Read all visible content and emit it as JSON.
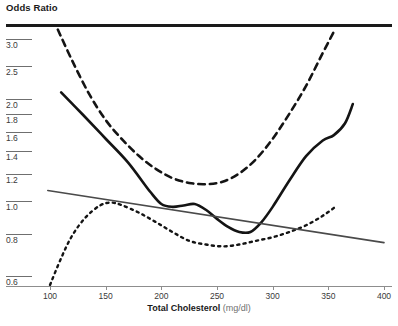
{
  "chart_data": {
    "type": "line",
    "title": "",
    "ylabel": "Odds Ratio",
    "xlabel": "Total Cholesterol",
    "xlabel_units": "(mg/dl)",
    "x_unit_note": "mg/dl",
    "scale": {
      "y": "log",
      "x": "linear"
    },
    "grid": false,
    "legend": "none",
    "xlim": [
      95,
      405
    ],
    "ylim": [
      0.6,
      3.4
    ],
    "xticks": [
      100,
      150,
      200,
      250,
      300,
      350,
      400
    ],
    "xtick_labels": [
      "100",
      "150",
      "200",
      "250",
      "300",
      "350",
      "400"
    ],
    "yticks": [
      0.6,
      0.8,
      1.0,
      1.2,
      1.4,
      1.6,
      1.8,
      2.0,
      2.5,
      3.0
    ],
    "ytick_labels": [
      "0.6",
      "0.8",
      "1.0",
      "1.2",
      "1.4",
      "1.6",
      "1.8",
      "2.0",
      "2.5",
      "3.0"
    ],
    "series": [
      {
        "name": "dashed-curve",
        "style": "dashed",
        "color": "#141414",
        "x": [
          107,
          120,
          135,
          150,
          165,
          180,
          195,
          210,
          225,
          240,
          255,
          270,
          285,
          300,
          315,
          330,
          345,
          356
        ],
        "y": [
          3.4,
          2.75,
          2.2,
          1.84,
          1.61,
          1.44,
          1.32,
          1.24,
          1.2,
          1.19,
          1.21,
          1.28,
          1.41,
          1.62,
          1.92,
          2.32,
          2.9,
          3.4
        ]
      },
      {
        "name": "solid-curve",
        "style": "solid",
        "color": "#141414",
        "x": [
          110,
          130,
          150,
          170,
          190,
          200,
          210,
          220,
          230,
          240,
          250,
          260,
          270,
          280,
          290,
          300,
          315,
          330,
          345,
          355,
          365,
          372
        ],
        "y": [
          2.22,
          1.9,
          1.62,
          1.38,
          1.13,
          1.04,
          1.02,
          1.03,
          1.04,
          1.0,
          0.94,
          0.89,
          0.86,
          0.86,
          0.92,
          1.02,
          1.22,
          1.44,
          1.6,
          1.66,
          1.8,
          2.05
        ]
      },
      {
        "name": "dotted-curve",
        "style": "dotted",
        "color": "#141414",
        "x": [
          100,
          110,
          120,
          132,
          145,
          155,
          165,
          180,
          195,
          210,
          225,
          240,
          255,
          270,
          285,
          300,
          315,
          330,
          345,
          358
        ],
        "y": [
          0.6,
          0.72,
          0.84,
          0.95,
          1.03,
          1.05,
          1.03,
          0.98,
          0.92,
          0.86,
          0.81,
          0.79,
          0.78,
          0.79,
          0.81,
          0.83,
          0.86,
          0.9,
          0.96,
          1.03
        ]
      },
      {
        "name": "straight-trend-line",
        "style": "thin-straight",
        "color": "#4a4a4a",
        "x": [
          98,
          400
        ],
        "y": [
          1.14,
          0.8
        ]
      }
    ]
  },
  "axes": {
    "y_title": "Odds Ratio",
    "x_title_bold": "Total Cholesterol",
    "x_title_units": "(mg/dl)"
  },
  "colors": {
    "curve_primary": "#141414",
    "trend_line": "#4a4a4a",
    "axis": "#8d8d8d",
    "tick_text": "#3a3a3a",
    "frame": "#1a1a1a",
    "background": "#ffffff"
  }
}
